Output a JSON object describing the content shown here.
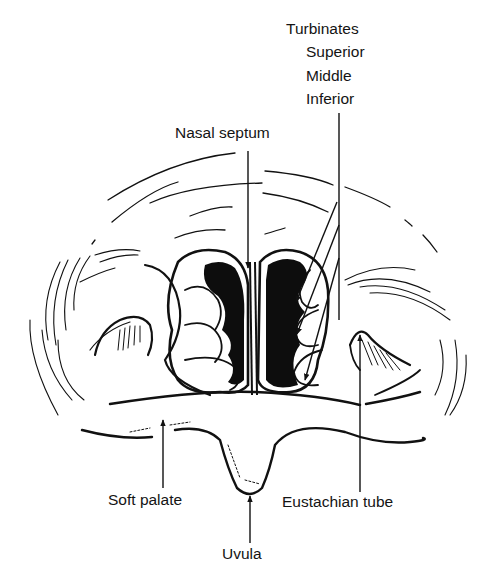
{
  "diagram": {
    "style": "black and white line drawing",
    "colors": {
      "ink": "#111111",
      "background": "#ffffff"
    }
  },
  "labels": {
    "turbinates_heading": "Turbinates",
    "turbinates": [
      "Superior",
      "Middle",
      "Inferior"
    ],
    "nasal_septum": "Nasal septum",
    "soft_palate": "Soft palate",
    "uvula": "Uvula",
    "eustachian_tube": "Eustachian tube"
  }
}
